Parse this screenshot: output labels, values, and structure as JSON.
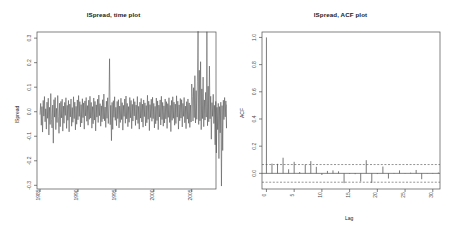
{
  "figure": {
    "width": 454,
    "height": 238,
    "background": "#ffffff",
    "foreground": "#4d4d4d"
  },
  "chart_data": [
    {
      "type": "line",
      "panel": "left",
      "title": "lSpread, time plot",
      "xlabel": "",
      "ylabel": "lSpread",
      "xlim": [
        1984.6,
        2008.2
      ],
      "ylim": [
        -0.315,
        0.325
      ],
      "xticks": [
        1985,
        1990,
        1995,
        2000,
        2005
      ],
      "xticklabels": [
        "1985",
        "1990",
        "1995",
        "2000",
        "2005"
      ],
      "yticks": [
        -0.3,
        -0.2,
        -0.1,
        0.0,
        0.1,
        0.2,
        0.3
      ],
      "yticklabels": [
        "-0.3",
        "-0.2",
        "-0.1",
        "0.0",
        "0.1",
        "0.2",
        "0.3"
      ],
      "grid": false,
      "legend": null,
      "line_color": "#4d4d4d",
      "x_start": 1985.0,
      "x_step": 0.0833333,
      "values": [
        -0.012,
        0.034,
        -0.055,
        0.021,
        -0.083,
        0.046,
        -0.018,
        0.062,
        -0.041,
        0.012,
        -0.071,
        0.039,
        -0.027,
        0.055,
        -0.095,
        0.018,
        -0.052,
        0.074,
        -0.031,
        -0.066,
        0.027,
        -0.128,
        0.049,
        -0.022,
        0.058,
        -0.073,
        0.014,
        -0.044,
        0.066,
        -0.019,
        -0.088,
        0.035,
        -0.061,
        0.042,
        -0.025,
        0.051,
        -0.079,
        0.023,
        -0.047,
        0.038,
        -0.015,
        0.057,
        -0.068,
        0.026,
        -0.035,
        0.046,
        -0.082,
        0.031,
        -0.021,
        0.052,
        -0.059,
        0.017,
        -0.043,
        0.061,
        -0.028,
        0.039,
        -0.074,
        0.022,
        -0.051,
        0.048,
        -0.033,
        0.066,
        -0.019,
        0.041,
        -0.062,
        0.029,
        -0.046,
        0.053,
        -0.024,
        0.036,
        -0.071,
        0.044,
        -0.017,
        0.058,
        -0.039,
        0.025,
        -0.055,
        0.047,
        -0.031,
        0.063,
        -0.026,
        0.038,
        -0.067,
        0.021,
        -0.049,
        0.056,
        -0.034,
        0.042,
        -0.078,
        0.028,
        -0.022,
        0.051,
        -0.044,
        0.068,
        -0.016,
        0.033,
        -0.059,
        0.024,
        -0.041,
        0.049,
        -0.029,
        0.072,
        -0.037,
        0.019,
        -0.064,
        0.043,
        -0.027,
        0.057,
        -0.048,
        0.031,
        0.216,
        -0.053,
        0.026,
        -0.118,
        0.038,
        -0.072,
        0.045,
        -0.023,
        0.061,
        -0.035,
        0.018,
        -0.057,
        0.042,
        -0.028,
        0.049,
        -0.066,
        0.023,
        -0.044,
        0.055,
        -0.032,
        0.037,
        -0.075,
        0.026,
        -0.019,
        0.052,
        -0.047,
        0.064,
        -0.029,
        0.034,
        -0.061,
        0.021,
        -0.043,
        0.058,
        -0.025,
        0.046,
        -0.069,
        0.03,
        -0.038,
        0.053,
        -0.017,
        0.041,
        -0.056,
        0.027,
        -0.033,
        0.062,
        -0.048,
        0.022,
        -0.071,
        0.039,
        -0.026,
        0.054,
        -0.042,
        0.031,
        -0.063,
        0.048,
        -0.02,
        0.036,
        -0.058,
        0.025,
        -0.045,
        0.067,
        -0.031,
        0.043,
        -0.077,
        0.029,
        -0.024,
        0.051,
        -0.039,
        0.059,
        -0.028,
        0.034,
        -0.066,
        0.022,
        -0.049,
        0.056,
        -0.036,
        0.044,
        -0.073,
        0.027,
        -0.021,
        0.048,
        -0.054,
        0.063,
        -0.032,
        0.038,
        -0.059,
        0.024,
        -0.046,
        0.052,
        -0.029,
        0.041,
        -0.068,
        0.033,
        -0.023,
        0.057,
        -0.044,
        0.026,
        -0.081,
        0.046,
        -0.035,
        0.061,
        -0.027,
        0.039,
        -0.055,
        0.031,
        -0.048,
        0.065,
        -0.022,
        0.043,
        -0.071,
        0.028,
        -0.037,
        0.054,
        -0.026,
        0.049,
        -0.062,
        0.034,
        -0.019,
        0.058,
        -0.045,
        0.023,
        -0.069,
        0.041,
        -0.03,
        0.052,
        -0.047,
        0.036,
        -0.064,
        0.027,
        -0.042,
        0.113,
        0.062,
        -0.038,
        0.098,
        -0.024,
        0.147,
        -0.046,
        0.086,
        -0.031,
        0.122,
        0.328,
        -0.052,
        0.169,
        -0.037,
        0.204,
        -0.073,
        0.093,
        -0.028,
        0.141,
        -0.061,
        0.048,
        -0.034,
        0.079,
        -0.022,
        0.326,
        -0.057,
        0.104,
        -0.041,
        0.186,
        -0.029,
        0.063,
        -0.112,
        0.037,
        -0.019,
        0.071,
        -0.048,
        0.026,
        -0.135,
        0.042,
        -0.168,
        0.018,
        -0.073,
        0.034,
        -0.191,
        0.021,
        -0.086,
        0.039,
        -0.303,
        0.025,
        -0.158,
        0.047,
        -0.032,
        0.058,
        -0.021,
        0.044,
        -0.067,
        0.029,
        -0.039,
        0.051,
        -0.026,
        0.036,
        -0.058,
        0.042,
        -0.024,
        0.049,
        -0.071,
        0.031,
        -0.043,
        0.056,
        -0.028,
        0.038,
        -0.062,
        0.027,
        -0.035,
        0.053,
        -0.046,
        0.033,
        -0.021,
        0.048,
        -0.057,
        0.025,
        -0.04,
        0.061,
        -0.03,
        0.044,
        -0.066,
        0.036,
        -0.023,
        0.052,
        -0.049,
        0.028,
        -0.034,
        0.058,
        -0.042,
        0.109,
        -0.027,
        0.037,
        -0.055,
        0.024
      ]
    },
    {
      "type": "bar",
      "panel": "right",
      "title": "lSpread, ACF plot",
      "xlabel": "Lag",
      "ylabel": "ACF",
      "xlim": [
        -0.8,
        31.3
      ],
      "ylim": [
        -0.115,
        1.04
      ],
      "xticks": [
        0,
        5,
        10,
        15,
        20,
        25,
        30
      ],
      "xticklabels": [
        "0",
        "5",
        "10",
        "15",
        "20",
        "25",
        "30"
      ],
      "yticks": [
        0.0,
        0.2,
        0.4,
        0.6,
        0.8,
        1.0
      ],
      "yticklabels": [
        "0.0",
        "0.2",
        "0.4",
        "0.6",
        "0.8",
        "1.0"
      ],
      "grid": false,
      "legend": null,
      "bar_color": "#4d4d4d",
      "confidence_band": 0.065,
      "confidence_style": "dashed",
      "zero_line": 0.0,
      "categories": [
        0,
        1,
        2,
        3,
        4,
        5,
        6,
        7,
        8,
        9,
        10,
        11,
        12,
        13,
        14,
        15,
        16,
        17,
        18,
        19,
        20,
        21,
        22,
        23,
        24,
        25,
        26,
        27,
        28,
        29,
        30,
        31
      ],
      "values": [
        1.0,
        0.072,
        0.07,
        0.115,
        0.03,
        0.085,
        0.01,
        0.065,
        0.09,
        0.048,
        -0.012,
        0.018,
        0.022,
        0.015,
        -0.072,
        -0.004,
        -0.006,
        -0.06,
        0.097,
        -0.07,
        -0.005,
        0.05,
        -0.038,
        0.003,
        0.022,
        -0.002,
        0.005,
        0.025,
        -0.043,
        0.002,
        0.003,
        0.006
      ]
    }
  ]
}
